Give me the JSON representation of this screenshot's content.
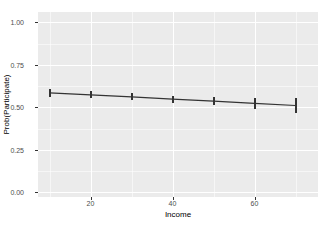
{
  "chart_data": {
    "type": "line",
    "title": "",
    "subtitle": "",
    "xlabel": "Income",
    "ylabel": "Prob(Participate)",
    "x": [
      10,
      20,
      30,
      40,
      50,
      60,
      70
    ],
    "values": [
      0.585,
      0.573,
      0.561,
      0.548,
      0.536,
      0.523,
      0.51
    ],
    "error_low": [
      0.562,
      0.552,
      0.541,
      0.527,
      0.511,
      0.49,
      0.465
    ],
    "error_high": [
      0.608,
      0.594,
      0.581,
      0.569,
      0.561,
      0.556,
      0.555
    ],
    "series": [
      {
        "name": "Prob(Participate)",
        "values": [
          0.585,
          0.573,
          0.561,
          0.548,
          0.536,
          0.523,
          0.51
        ]
      }
    ],
    "xlim": [
      7.2,
      75.5
    ],
    "ylim": [
      -0.028,
      1.06
    ],
    "x_ticks": [
      20,
      40,
      60
    ],
    "x_tick_labels": [
      "20",
      "40",
      "60"
    ],
    "y_ticks": [
      0.0,
      0.25,
      0.5,
      0.75,
      1.0
    ],
    "y_tick_labels": [
      "0.00",
      "0.25",
      "0.50",
      "0.75",
      "1.00"
    ],
    "x_minor_ticks": [
      10,
      30,
      50,
      70
    ],
    "y_minor_ticks": [
      0.125,
      0.375,
      0.625,
      0.875
    ],
    "grid": true,
    "legend": "none",
    "panel_background": "#ebebeb",
    "grid_color": "#ffffff",
    "line_color": "#333333",
    "errorbar_color": "#333333",
    "text_color": "#4d4d4d",
    "title_color": "#000000"
  }
}
